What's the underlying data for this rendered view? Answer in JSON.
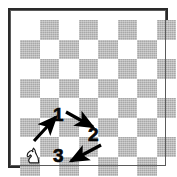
{
  "diagram": {
    "kind": "chessboard-knight-move-diagram",
    "board": {
      "rows": 8,
      "cols": 8,
      "light_color": "#ffffff",
      "dark_color": "#a8a8a8",
      "border_color": "#2a2a2a",
      "top_left_square": "light",
      "pattern": [
        [
          "light",
          "dark",
          "light",
          "dark",
          "light",
          "dark",
          "light",
          "dark"
        ],
        [
          "dark",
          "light",
          "dark",
          "light",
          "dark",
          "light",
          "dark",
          "light"
        ],
        [
          "light",
          "dark",
          "light",
          "dark",
          "light",
          "dark",
          "light",
          "dark"
        ],
        [
          "dark",
          "light",
          "dark",
          "light",
          "dark",
          "light",
          "dark",
          "light"
        ],
        [
          "light",
          "dark",
          "light",
          "dark",
          "light",
          "dark",
          "light",
          "dark"
        ],
        [
          "dark",
          "light",
          "dark",
          "light",
          "dark",
          "light",
          "dark",
          "light"
        ],
        [
          "light",
          "dark",
          "light",
          "dark",
          "light",
          "dark",
          "light",
          "dark"
        ],
        [
          "dark",
          "light",
          "dark",
          "light",
          "dark",
          "light",
          "dark",
          "light"
        ]
      ]
    },
    "piece": {
      "type": "knight",
      "color": "white",
      "icon": "knight-icon",
      "square_row": 8,
      "square_col": 2
    },
    "move_labels": [
      {
        "id": "1",
        "text": "1",
        "x": 53,
        "y": 105
      },
      {
        "id": "2",
        "text": "2",
        "x": 88,
        "y": 125
      },
      {
        "id": "3",
        "text": "3",
        "x": 53,
        "y": 146
      }
    ],
    "arrows": [
      {
        "id": "arrow-1",
        "from": [
          34,
          141
        ],
        "to": [
          56,
          117
        ],
        "label": "1",
        "color": "#000000"
      },
      {
        "id": "arrow-2",
        "from": [
          66,
          112
        ],
        "to": [
          93,
          127
        ],
        "label": "2",
        "color": "#000000"
      },
      {
        "id": "arrow-3",
        "from": [
          101,
          145
        ],
        "to": [
          71,
          161
        ],
        "label": "3",
        "color": "#000000"
      }
    ],
    "colors": {
      "ink": "#000000",
      "light_square": "#ffffff",
      "dark_square": "#a8a8a8",
      "frame": "#2a2a2a",
      "page_background": "#ffffff"
    }
  }
}
